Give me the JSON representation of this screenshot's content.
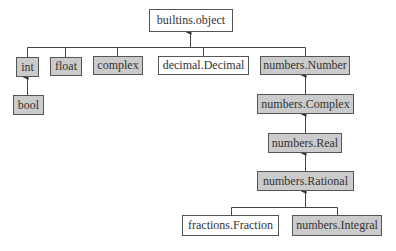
{
  "diagram": {
    "colors": {
      "abc_fill": "#cbcbcb",
      "concrete_fill": "#ffffff",
      "line": "#444444"
    },
    "nodes": [
      {
        "id": "object",
        "label": "builtins.object",
        "kind": "concrete"
      },
      {
        "id": "int",
        "label": "int",
        "kind": "abc"
      },
      {
        "id": "float",
        "label": "float",
        "kind": "abc"
      },
      {
        "id": "complex",
        "label": "complex",
        "kind": "abc"
      },
      {
        "id": "decimal",
        "label": "decimal.Decimal",
        "kind": "concrete"
      },
      {
        "id": "number",
        "label": "numbers.Number",
        "kind": "abc"
      },
      {
        "id": "bool",
        "label": "bool",
        "kind": "abc"
      },
      {
        "id": "ncomplex",
        "label": "numbers.Complex",
        "kind": "abc"
      },
      {
        "id": "real",
        "label": "numbers.Real",
        "kind": "abc"
      },
      {
        "id": "rational",
        "label": "numbers.Rational",
        "kind": "abc"
      },
      {
        "id": "fraction",
        "label": "fractions.Fraction",
        "kind": "concrete"
      },
      {
        "id": "integral",
        "label": "numbers.Integral",
        "kind": "abc"
      }
    ],
    "edges": [
      {
        "from": "int",
        "to": "object"
      },
      {
        "from": "float",
        "to": "object"
      },
      {
        "from": "complex",
        "to": "object"
      },
      {
        "from": "decimal",
        "to": "object"
      },
      {
        "from": "number",
        "to": "object"
      },
      {
        "from": "bool",
        "to": "int"
      },
      {
        "from": "ncomplex",
        "to": "number"
      },
      {
        "from": "real",
        "to": "ncomplex"
      },
      {
        "from": "rational",
        "to": "real"
      },
      {
        "from": "fraction",
        "to": "rational"
      },
      {
        "from": "integral",
        "to": "rational"
      }
    ]
  }
}
